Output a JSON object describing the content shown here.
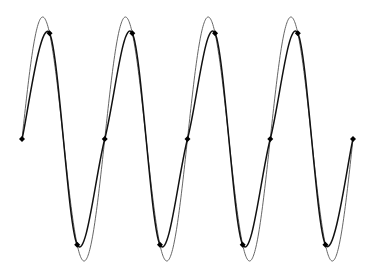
{
  "chart_data": {
    "type": "line",
    "title": "",
    "xlabel": "",
    "ylabel": "",
    "grid": false,
    "legend": "none",
    "axes_visible": false,
    "xlim": [
      0,
      12
    ],
    "ylim": [
      -1,
      1
    ],
    "series": [
      {
        "name": "continuous sine",
        "style": "thin line",
        "function": "sin(2*pi*t/3)",
        "t_range": [
          0,
          12
        ],
        "color": "#555555"
      },
      {
        "name": "sampled / interpolated",
        "style": "thick line with diamond markers",
        "x": [
          0,
          1,
          2,
          3,
          4,
          5,
          6,
          7,
          8,
          9,
          10,
          11,
          12
        ],
        "values": [
          0,
          0.866,
          -0.866,
          0,
          0.866,
          -0.866,
          0,
          0.866,
          -0.866,
          0,
          0.866,
          -0.866,
          0
        ],
        "color": "#111111"
      }
    ]
  }
}
